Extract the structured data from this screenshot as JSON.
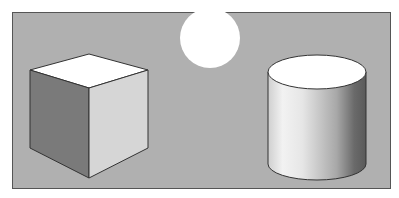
{
  "scene": {
    "description": "Grayscale illustration of a cube, a sphere/sun disc, and a cylinder on a gray background",
    "colors": {
      "page_bg": "#ffffff",
      "frame_bg": "#b0b0b0",
      "frame_border": "#555555",
      "cube_top": "#ffffff",
      "cube_left": "#7a7a7a",
      "cube_right": "#d4d4d4",
      "cube_edge": "#333333",
      "sun": "#ffffff",
      "cylinder_top": "#ffffff",
      "cylinder_light": "#f4f4f4",
      "cylinder_dark": "#5a5a5a"
    },
    "objects": [
      {
        "name": "cube",
        "label": "Cube"
      },
      {
        "name": "sun",
        "label": "Light source"
      },
      {
        "name": "cylinder",
        "label": "Cylinder"
      }
    ]
  }
}
